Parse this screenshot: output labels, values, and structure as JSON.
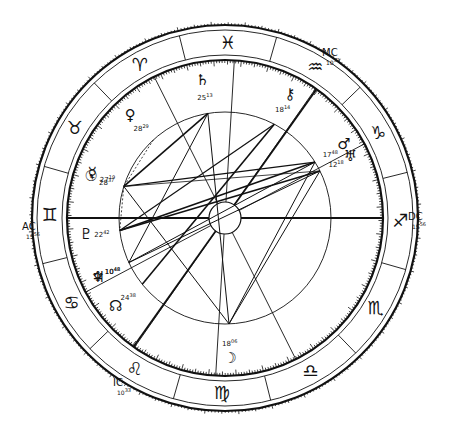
{
  "chart_data": {
    "type": "natal-chart-wheel",
    "title": "",
    "center": [
      225,
      218
    ],
    "angles": {
      "AC": {
        "label": "AC",
        "degree": "15",
        "minute": "56",
        "sign": "gemini"
      },
      "DC": {
        "label": "DC",
        "degree": "15",
        "minute": "56",
        "sign": "sagittarius"
      },
      "MC": {
        "label": "MC",
        "degree": "10",
        "minute": "33",
        "sign": "aquarius"
      },
      "IC": {
        "label": "IC",
        "degree": "10",
        "minute": "33",
        "sign": "leo"
      }
    },
    "zodiac_signs": [
      {
        "name": "aries",
        "glyph": "♈"
      },
      {
        "name": "taurus",
        "glyph": "♉"
      },
      {
        "name": "gemini",
        "glyph": "♊"
      },
      {
        "name": "cancer",
        "glyph": "♋"
      },
      {
        "name": "leo",
        "glyph": "♌"
      },
      {
        "name": "virgo",
        "glyph": "♍"
      },
      {
        "name": "libra",
        "glyph": "♎"
      },
      {
        "name": "scorpio",
        "glyph": "♏"
      },
      {
        "name": "sagittarius",
        "glyph": "♐"
      },
      {
        "name": "capricorn",
        "glyph": "♑"
      },
      {
        "name": "aquarius",
        "glyph": "♒"
      },
      {
        "name": "pisces",
        "glyph": "♓"
      }
    ],
    "planets": [
      {
        "name": "sun",
        "glyph": "☉",
        "degree": "28",
        "minute": "37",
        "sign": "taurus"
      },
      {
        "name": "moon",
        "glyph": "☽",
        "degree": "18",
        "minute": "06",
        "sign": "virgo"
      },
      {
        "name": "mercury",
        "glyph": "☿",
        "degree": "27",
        "minute": "19",
        "sign": "taurus"
      },
      {
        "name": "venus",
        "glyph": "♀",
        "degree": "28",
        "minute": "29",
        "sign": "aries"
      },
      {
        "name": "mars",
        "glyph": "♂",
        "degree": "17",
        "minute": "48",
        "sign": "capricorn"
      },
      {
        "name": "jupiter",
        "glyph": "♃",
        "degree": "10",
        "minute": "48",
        "sign": "cancer"
      },
      {
        "name": "saturn",
        "glyph": "♄",
        "degree": "25",
        "minute": "13",
        "sign": "pisces"
      },
      {
        "name": "uranus",
        "glyph": "♅",
        "degree": "12",
        "minute": "18",
        "sign": "capricorn"
      },
      {
        "name": "neptune",
        "glyph": "♆",
        "degree": "10",
        "minute": "48",
        "sign": "cancer"
      },
      {
        "name": "pluto",
        "glyph": "♇",
        "degree": "22",
        "minute": "42",
        "sign": "gemini"
      },
      {
        "name": "chiron",
        "glyph": "⚷",
        "degree": "18",
        "minute": "14",
        "sign": "aquarius"
      },
      {
        "name": "north-node",
        "glyph": "☊",
        "degree": "24",
        "minute": "38",
        "sign": "cancer"
      }
    ],
    "aspect_lines": "straight lines connecting planet positions on inner circle",
    "grid": false,
    "legend": "none"
  }
}
